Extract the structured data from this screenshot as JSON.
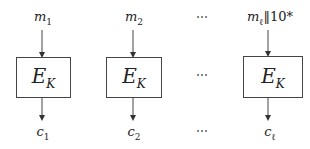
{
  "diagram": {
    "type": "block-cipher-ecb-mode",
    "blocks": [
      {
        "input_base": "m",
        "input_sub": "1",
        "cipher_base": "E",
        "cipher_sub": "K",
        "output_base": "c",
        "output_sub": "1"
      },
      {
        "input_base": "m",
        "input_sub": "2",
        "cipher_base": "E",
        "cipher_sub": "K",
        "output_base": "c",
        "output_sub": "2"
      },
      {
        "input_base": "m",
        "input_sub": "ℓ",
        "input_suffix": "‖10*",
        "cipher_base": "E",
        "cipher_sub": "K",
        "output_base": "c",
        "output_sub": "ℓ"
      }
    ],
    "ellipsis": "⋯"
  }
}
